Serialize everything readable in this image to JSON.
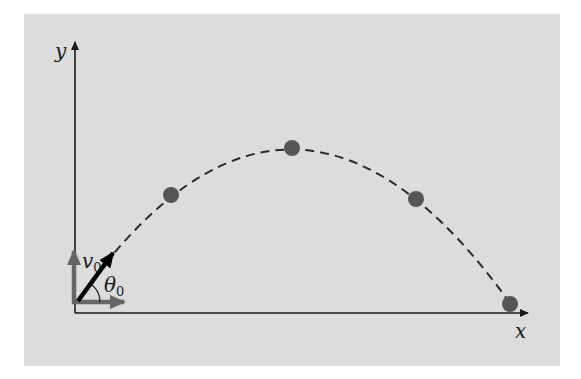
{
  "figure": {
    "type": "projectile-motion-diagram",
    "axes": {
      "x_label": "x",
      "y_label": "y"
    },
    "vectors": {
      "initial_velocity_label": "v",
      "initial_velocity_subscript": "0",
      "launch_angle_label": "θ",
      "launch_angle_subscript": "0"
    },
    "trajectory": {
      "style": "dashed parabola",
      "points_count": 4
    },
    "colors": {
      "background_panel": "#dcdcdc",
      "axis": "#1a1a1a",
      "trajectory": "#2a2a2a",
      "dots": "#555555",
      "component_arrows": "#666666",
      "velocity_arrow": "#000000"
    }
  }
}
